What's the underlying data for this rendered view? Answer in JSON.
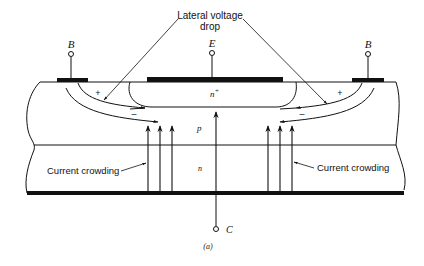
{
  "figure": {
    "caption": "(a)",
    "colors": {
      "ink": "#111111",
      "background": "#ffffff"
    }
  },
  "terminals": {
    "base_left": "B",
    "emitter": "E",
    "base_right": "B",
    "collector": "C"
  },
  "regions": {
    "emitter": "n",
    "emitter_sup": "+",
    "base": "p",
    "collector": "n"
  },
  "annotations": {
    "lateral_voltage_drop_line1": "Lateral voltage",
    "lateral_voltage_drop_line2": "drop",
    "current_crowding_left": "Current crowding",
    "current_crowding_right": "Current crowding",
    "plus_left": "+",
    "minus_left": "–",
    "plus_right": "+",
    "minus_right": "–"
  }
}
